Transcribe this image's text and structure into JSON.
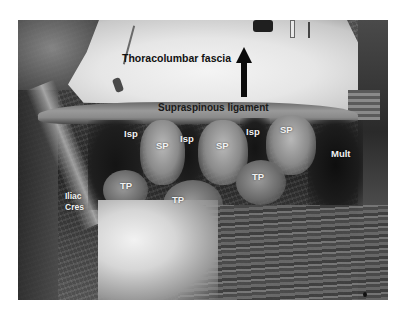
{
  "figure": {
    "type": "anatomical-dissection-photograph",
    "colorscale": "grayscale",
    "labels": {
      "thoracolumbar_fascia": "Thoracolumbar fascia",
      "supraspinous_ligament": "Supraspinous ligament",
      "isp": [
        "Isp",
        "Isp",
        "Isp"
      ],
      "sp": [
        "SP",
        "SP",
        "SP"
      ],
      "mult": "Mult",
      "tp": [
        "TP",
        "TP",
        "TP"
      ],
      "iliac_crest_line1": "Iliac",
      "iliac_crest_line2": "Cres"
    },
    "arrow": {
      "direction": "up",
      "color": "#0a0a0a"
    },
    "colors": {
      "fascia": "#eeeeee",
      "muscle_dark": "#2a2a2a",
      "label_dark": "#111111",
      "label_light": "#f2f2f2",
      "background": "#ffffff"
    }
  }
}
